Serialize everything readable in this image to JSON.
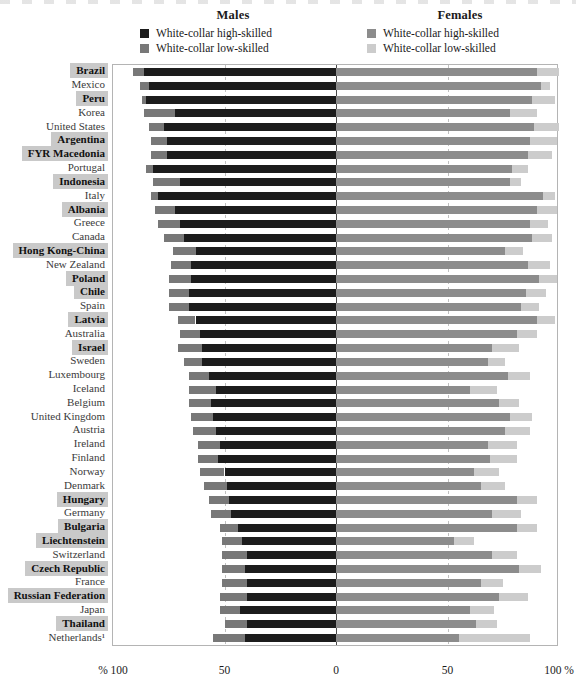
{
  "legend": {
    "males": {
      "title": "Males",
      "items": [
        {
          "label": "White-collar high-skilled",
          "color": "#1c1c1c",
          "icon": "legend-swatch-icon"
        },
        {
          "label": "White-collar low-skilled",
          "color": "#787878",
          "icon": "legend-swatch-icon"
        }
      ]
    },
    "females": {
      "title": "Females",
      "items": [
        {
          "label": "White-collar high-skilled",
          "color": "#8c8c8c",
          "icon": "legend-swatch-icon"
        },
        {
          "label": "White-collar low-skilled",
          "color": "#cccccc",
          "icon": "legend-swatch-icon"
        }
      ]
    }
  },
  "axis": {
    "ticks": [
      {
        "label": "% 100",
        "value": -100
      },
      {
        "label": "50",
        "value": -50
      },
      {
        "label": "0",
        "value": 0
      },
      {
        "label": "50",
        "value": 50
      },
      {
        "label": "100 %",
        "value": 100
      }
    ]
  },
  "chart_data": {
    "type": "bar",
    "subtype": "diverging-stacked-bar",
    "title": "",
    "xlabel": "",
    "ylabel": "",
    "xlim": [
      -100,
      100
    ],
    "grid": true,
    "legend_position": "top",
    "series": [
      {
        "name": "Males: White-collar high-skilled",
        "side": "left",
        "color": "#1c1c1c"
      },
      {
        "name": "Males: White-collar low-skilled",
        "side": "left",
        "color": "#787878"
      },
      {
        "name": "Females: White-collar high-skilled",
        "side": "right",
        "color": "#8c8c8c"
      },
      {
        "name": "Females: White-collar low-skilled",
        "side": "right",
        "color": "#cccccc"
      }
    ],
    "categories": [
      "Brazil",
      "Mexico",
      "Peru",
      "Korea",
      "United States",
      "Argentina",
      "FYR Macedonia",
      "Portugal",
      "Indonesia",
      "Italy",
      "Albania",
      "Greece",
      "Canada",
      "Hong Kong-China",
      "New Zealand",
      "Poland",
      "Chile",
      "Spain",
      "Latvia",
      "Australia",
      "Israel",
      "Sweden",
      "Luxembourg",
      "Iceland",
      "Belgium",
      "United Kingdom",
      "Austria",
      "Ireland",
      "Finland",
      "Norway",
      "Denmark",
      "Hungary",
      "Germany",
      "Bulgaria",
      "Liechtenstein",
      "Switzerland",
      "Czech Republic",
      "France",
      "Russian Federation",
      "Japan",
      "Thailand",
      "Netherlands¹"
    ],
    "rows": [
      {
        "category": "Brazil",
        "highlight": true,
        "m_high": 86,
        "m_low": 5,
        "f_high": 90,
        "f_low": 10
      },
      {
        "category": "Mexico",
        "highlight": false,
        "m_high": 84,
        "m_low": 4,
        "f_high": 92,
        "f_low": 4
      },
      {
        "category": "Peru",
        "highlight": true,
        "m_high": 85,
        "m_low": 2,
        "f_high": 88,
        "f_low": 10
      },
      {
        "category": "Korea",
        "highlight": false,
        "m_high": 72,
        "m_low": 14,
        "f_high": 78,
        "f_low": 12
      },
      {
        "category": "United States",
        "highlight": false,
        "m_high": 77,
        "m_low": 7,
        "f_high": 89,
        "f_low": 11
      },
      {
        "category": "Argentina",
        "highlight": true,
        "m_high": 76,
        "m_low": 7,
        "f_high": 87,
        "f_low": 12
      },
      {
        "category": "FYR Macedonia",
        "highlight": true,
        "m_high": 76,
        "m_low": 7,
        "f_high": 86,
        "f_low": 11
      },
      {
        "category": "Portugal",
        "highlight": false,
        "m_high": 82,
        "m_low": 3,
        "f_high": 79,
        "f_low": 7
      },
      {
        "category": "Indonesia",
        "highlight": true,
        "m_high": 70,
        "m_low": 12,
        "f_high": 78,
        "f_low": 5
      },
      {
        "category": "Italy",
        "highlight": false,
        "m_high": 80,
        "m_low": 3,
        "f_high": 93,
        "f_low": 5
      },
      {
        "category": "Albania",
        "highlight": true,
        "m_high": 72,
        "m_low": 9,
        "f_high": 90,
        "f_low": 9
      },
      {
        "category": "Greece",
        "highlight": false,
        "m_high": 70,
        "m_low": 10,
        "f_high": 87,
        "f_low": 8
      },
      {
        "category": "Canada",
        "highlight": false,
        "m_high": 68,
        "m_low": 9,
        "f_high": 88,
        "f_low": 9
      },
      {
        "category": "Hong Kong-China",
        "highlight": true,
        "m_high": 63,
        "m_low": 10,
        "f_high": 76,
        "f_low": 8
      },
      {
        "category": "New Zealand",
        "highlight": false,
        "m_high": 65,
        "m_low": 9,
        "f_high": 86,
        "f_low": 10
      },
      {
        "category": "Poland",
        "highlight": true,
        "m_high": 65,
        "m_low": 10,
        "f_high": 91,
        "f_low": 8
      },
      {
        "category": "Chile",
        "highlight": true,
        "m_high": 66,
        "m_low": 9,
        "f_high": 85,
        "f_low": 9
      },
      {
        "category": "Spain",
        "highlight": false,
        "m_high": 66,
        "m_low": 9,
        "f_high": 83,
        "f_low": 8
      },
      {
        "category": "Latvia",
        "highlight": true,
        "m_high": 63,
        "m_low": 8,
        "f_high": 90,
        "f_low": 8
      },
      {
        "category": "Australia",
        "highlight": false,
        "m_high": 61,
        "m_low": 9,
        "f_high": 81,
        "f_low": 9
      },
      {
        "category": "Israel",
        "highlight": true,
        "m_high": 60,
        "m_low": 11,
        "f_high": 70,
        "f_low": 12
      },
      {
        "category": "Sweden",
        "highlight": false,
        "m_high": 60,
        "m_low": 8,
        "f_high": 68,
        "f_low": 8
      },
      {
        "category": "Luxembourg",
        "highlight": false,
        "m_high": 57,
        "m_low": 9,
        "f_high": 77,
        "f_low": 10
      },
      {
        "category": "Iceland",
        "highlight": false,
        "m_high": 54,
        "m_low": 12,
        "f_high": 60,
        "f_low": 12
      },
      {
        "category": "Belgium",
        "highlight": false,
        "m_high": 56,
        "m_low": 10,
        "f_high": 73,
        "f_low": 9
      },
      {
        "category": "United Kingdom",
        "highlight": false,
        "m_high": 55,
        "m_low": 10,
        "f_high": 78,
        "f_low": 10
      },
      {
        "category": "Austria",
        "highlight": false,
        "m_high": 54,
        "m_low": 10,
        "f_high": 76,
        "f_low": 11
      },
      {
        "category": "Ireland",
        "highlight": false,
        "m_high": 52,
        "m_low": 10,
        "f_high": 68,
        "f_low": 13
      },
      {
        "category": "Finland",
        "highlight": false,
        "m_high": 53,
        "m_low": 9,
        "f_high": 69,
        "f_low": 12
      },
      {
        "category": "Norway",
        "highlight": false,
        "m_high": 50,
        "m_low": 11,
        "f_high": 62,
        "f_low": 11
      },
      {
        "category": "Denmark",
        "highlight": false,
        "m_high": 49,
        "m_low": 10,
        "f_high": 65,
        "f_low": 11
      },
      {
        "category": "Hungary",
        "highlight": true,
        "m_high": 48,
        "m_low": 9,
        "f_high": 81,
        "f_low": 9
      },
      {
        "category": "Germany",
        "highlight": false,
        "m_high": 47,
        "m_low": 9,
        "f_high": 70,
        "f_low": 13
      },
      {
        "category": "Bulgaria",
        "highlight": true,
        "m_high": 44,
        "m_low": 8,
        "f_high": 81,
        "f_low": 9
      },
      {
        "category": "Liechtenstein",
        "highlight": true,
        "m_high": 42,
        "m_low": 9,
        "f_high": 53,
        "f_low": 9
      },
      {
        "category": "Switzerland",
        "highlight": false,
        "m_high": 40,
        "m_low": 11,
        "f_high": 70,
        "f_low": 11
      },
      {
        "category": "Czech Republic",
        "highlight": true,
        "m_high": 41,
        "m_low": 10,
        "f_high": 82,
        "f_low": 10
      },
      {
        "category": "France",
        "highlight": false,
        "m_high": 40,
        "m_low": 11,
        "f_high": 65,
        "f_low": 10
      },
      {
        "category": "Russian Federation",
        "highlight": true,
        "m_high": 40,
        "m_low": 12,
        "f_high": 73,
        "f_low": 13
      },
      {
        "category": "Japan",
        "highlight": false,
        "m_high": 43,
        "m_low": 9,
        "f_high": 60,
        "f_low": 11
      },
      {
        "category": "Thailand",
        "highlight": true,
        "m_high": 40,
        "m_low": 10,
        "f_high": 63,
        "f_low": 9
      },
      {
        "category": "Netherlands¹",
        "highlight": false,
        "m_high": 41,
        "m_low": 14,
        "f_high": 55,
        "f_low": 32
      }
    ]
  }
}
